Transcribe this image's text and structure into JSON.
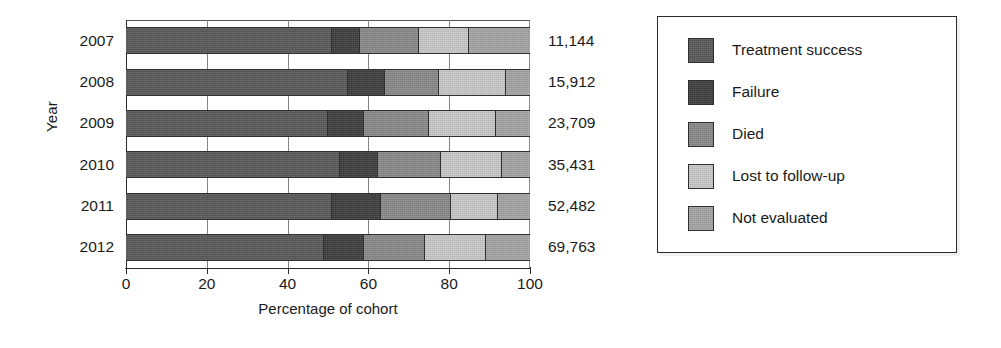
{
  "chart_data": {
    "type": "bar",
    "orientation": "horizontal",
    "stacked": true,
    "stack_mode": "percent",
    "title": "",
    "xlabel": "Percentage of cohort",
    "ylabel": "Year",
    "xlim": [
      0,
      100
    ],
    "xticks": [
      0,
      20,
      40,
      60,
      80,
      100
    ],
    "xtick_labels": [
      "0",
      "20",
      "40",
      "60",
      "80",
      "100"
    ],
    "grid": false,
    "legend_position": "right",
    "categories": [
      "2007",
      "2008",
      "2009",
      "2010",
      "2011",
      "2012"
    ],
    "series": [
      {
        "name": "Treatment success",
        "color": "#5a5a5a",
        "values": [
          51,
          55,
          50,
          53,
          51,
          49
        ]
      },
      {
        "name": "Failure",
        "color": "#3f3f3f",
        "values": [
          7,
          9,
          9,
          9.5,
          12,
          10
        ]
      },
      {
        "name": "Died",
        "color": "#8a8a8a",
        "values": [
          14.5,
          13.5,
          16,
          15.5,
          17.5,
          15
        ]
      },
      {
        "name": "Lost to follow-up",
        "color": "#c9c9c9",
        "values": [
          12.5,
          16.5,
          16.5,
          15,
          11.5,
          15
        ]
      },
      {
        "name": "Not evaluated",
        "color": "#a6a6a6",
        "values": [
          15,
          6,
          8.5,
          7,
          8,
          11
        ]
      }
    ],
    "bar_totals": [
      "11,144",
      "15,912",
      "23,709",
      "35,431",
      "52,482",
      "69,763"
    ],
    "annotations": [
      "Totals at the right of each bar give the cohort size for that year."
    ]
  },
  "legend": {
    "items": [
      {
        "label": "Treatment success",
        "color": "#5a5a5a"
      },
      {
        "label": "Failure",
        "color": "#3f3f3f"
      },
      {
        "label": "Died",
        "color": "#8a8a8a"
      },
      {
        "label": "Lost to follow-up",
        "color": "#c9c9c9"
      },
      {
        "label": "Not evaluated",
        "color": "#a6a6a6"
      }
    ]
  }
}
